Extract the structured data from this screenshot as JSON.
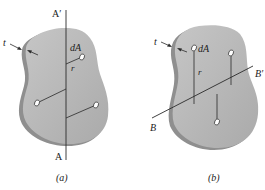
{
  "figures": [
    {
      "id": "a",
      "caption": "(a)",
      "axis_top_label": "A′",
      "axis_bottom_label": "A",
      "thickness_label": "t",
      "element_label": "dA",
      "radius_label": "r"
    },
    {
      "id": "b",
      "caption": "(b)",
      "axis_left_label": "B",
      "axis_right_label": "B′",
      "thickness_label": "t",
      "element_label": "dA",
      "radius_label": "r"
    }
  ],
  "colors": {
    "plate_face": "#b9b9b9",
    "plate_edge": "#8e8e8e",
    "line": "#2a2a2a",
    "text": "#222222"
  }
}
